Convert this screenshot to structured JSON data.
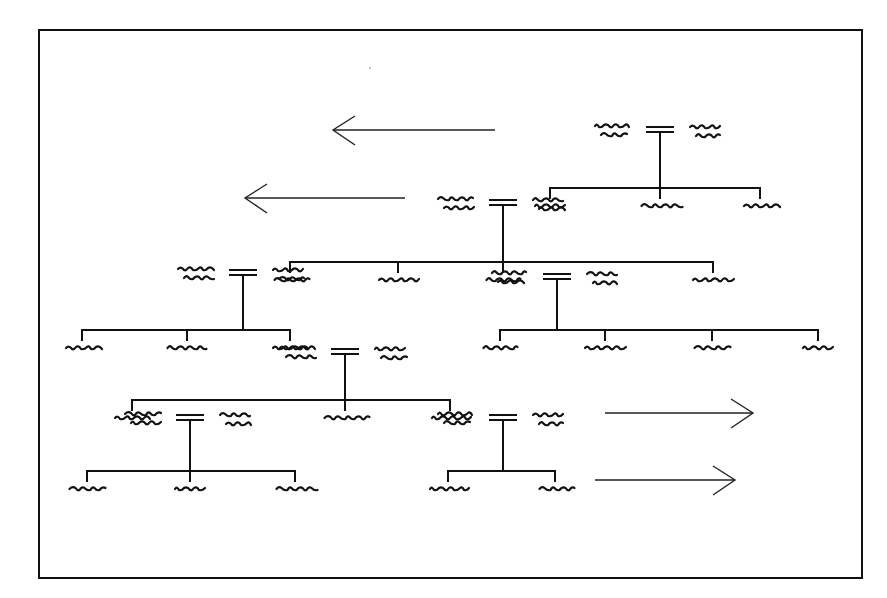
{
  "diagram": {
    "type": "genealogical-tree",
    "frame": {
      "x": 39,
      "y": 30,
      "w": 823,
      "h": 548
    },
    "stroke_color": "#111111",
    "note": "Names rendered as illegible scribbles (placeholder handwriting)",
    "arrows": [
      {
        "id": "arrow-left-1",
        "direction": "left",
        "x1": 495,
        "x2": 333,
        "y": 130
      },
      {
        "id": "arrow-left-2",
        "direction": "left",
        "x1": 405,
        "x2": 245,
        "y": 198
      },
      {
        "id": "arrow-right-1",
        "direction": "right",
        "x1": 605,
        "x2": 753,
        "y": 413
      },
      {
        "id": "arrow-right-2",
        "direction": "right",
        "x1": 595,
        "x2": 735,
        "y": 480
      }
    ],
    "families": [
      {
        "id": "family-1",
        "marriage_x": 660,
        "marriage_y": 130,
        "bar_y": 188,
        "children_x": [
          550,
          660,
          760
        ]
      },
      {
        "id": "family-2",
        "marriage_x": 503,
        "marriage_y": 203,
        "bar_y": 262,
        "children_x": [
          290,
          398,
          503,
          713
        ]
      },
      {
        "id": "family-3",
        "marriage_x": 243,
        "marriage_y": 273,
        "bar_y": 330,
        "children_x": [
          82,
          187,
          290
        ]
      },
      {
        "id": "family-4",
        "marriage_x": 557,
        "marriage_y": 277,
        "bar_y": 330,
        "children_x": [
          500,
          605,
          712,
          818
        ]
      },
      {
        "id": "family-5",
        "marriage_x": 345,
        "marriage_y": 352,
        "bar_y": 400,
        "children_x": [
          132,
          345,
          450
        ]
      },
      {
        "id": "family-6",
        "marriage_x": 190,
        "marriage_y": 418,
        "bar_y": 471,
        "children_x": [
          87,
          190,
          295
        ]
      },
      {
        "id": "family-7",
        "marriage_x": 503,
        "marriage_y": 418,
        "bar_y": 471,
        "children_x": [
          448,
          555
        ]
      }
    ]
  }
}
